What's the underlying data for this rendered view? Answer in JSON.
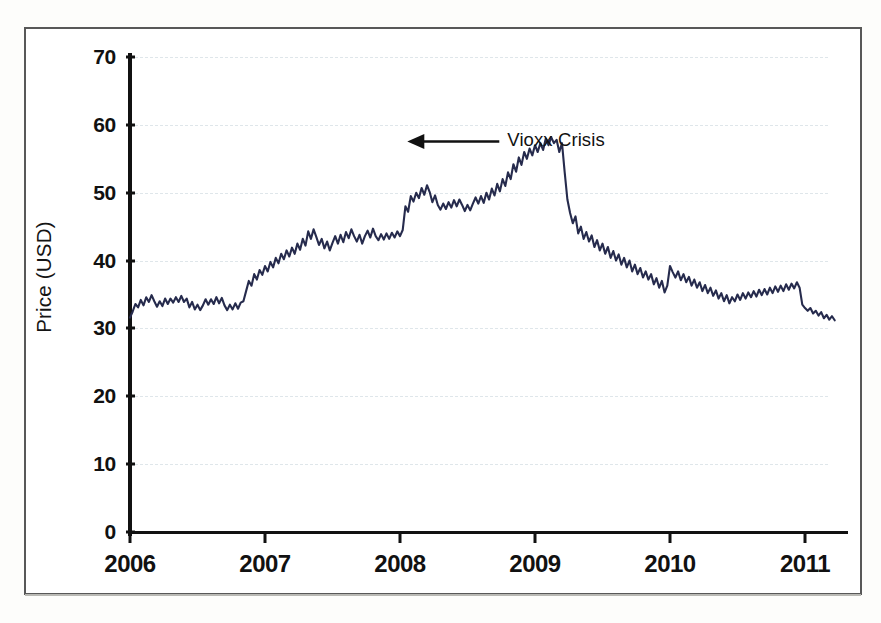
{
  "chart_data": {
    "type": "line",
    "title": "",
    "xlabel": "",
    "ylabel": "Price (USD)",
    "ylim": [
      0,
      70
    ],
    "ytick_values": [
      0,
      10,
      20,
      30,
      40,
      50,
      60,
      70
    ],
    "ytick_labels": [
      "0",
      "10",
      "20",
      "30",
      "40",
      "50",
      "60",
      "70"
    ],
    "xlim": [
      2006.0,
      2011.3
    ],
    "xtick_values": [
      2006,
      2007,
      2008,
      2009,
      2010,
      2011
    ],
    "xtick_labels": [
      "2006",
      "2007",
      "2008",
      "2009",
      "2010",
      "2011"
    ],
    "grid": "horizontal-dashed",
    "legend": "none",
    "line_color": "#262b4d",
    "series": [
      {
        "name": "Price (USD)",
        "x": [
          2006.0,
          2006.02,
          2006.04,
          2006.06,
          2006.08,
          2006.1,
          2006.12,
          2006.14,
          2006.16,
          2006.18,
          2006.2,
          2006.22,
          2006.24,
          2006.26,
          2006.28,
          2006.3,
          2006.32,
          2006.34,
          2006.36,
          2006.38,
          2006.4,
          2006.42,
          2006.44,
          2006.46,
          2006.48,
          2006.5,
          2006.52,
          2006.54,
          2006.56,
          2006.58,
          2006.6,
          2006.62,
          2006.64,
          2006.66,
          2006.68,
          2006.7,
          2006.72,
          2006.74,
          2006.76,
          2006.78,
          2006.8,
          2006.82,
          2006.84,
          2006.86,
          2006.88,
          2006.9,
          2006.92,
          2006.94,
          2006.96,
          2006.98,
          2007.0,
          2007.02,
          2007.04,
          2007.06,
          2007.08,
          2007.1,
          2007.12,
          2007.14,
          2007.16,
          2007.18,
          2007.2,
          2007.22,
          2007.24,
          2007.26,
          2007.28,
          2007.3,
          2007.32,
          2007.34,
          2007.36,
          2007.38,
          2007.4,
          2007.42,
          2007.44,
          2007.46,
          2007.48,
          2007.5,
          2007.52,
          2007.54,
          2007.56,
          2007.58,
          2007.6,
          2007.62,
          2007.64,
          2007.66,
          2007.68,
          2007.7,
          2007.72,
          2007.74,
          2007.76,
          2007.78,
          2007.8,
          2007.82,
          2007.84,
          2007.86,
          2007.88,
          2007.9,
          2007.92,
          2007.94,
          2007.96,
          2007.98,
          2008.0,
          2008.02,
          2008.04,
          2008.06,
          2008.08,
          2008.1,
          2008.12,
          2008.14,
          2008.16,
          2008.18,
          2008.2,
          2008.22,
          2008.24,
          2008.26,
          2008.28,
          2008.3,
          2008.32,
          2008.34,
          2008.36,
          2008.38,
          2008.4,
          2008.42,
          2008.44,
          2008.46,
          2008.48,
          2008.5,
          2008.52,
          2008.54,
          2008.56,
          2008.58,
          2008.6,
          2008.62,
          2008.64,
          2008.66,
          2008.68,
          2008.7,
          2008.72,
          2008.74,
          2008.76,
          2008.78,
          2008.8,
          2008.82,
          2008.84,
          2008.86,
          2008.88,
          2008.9,
          2008.92,
          2008.94,
          2008.96,
          2008.98,
          2009.0,
          2009.02,
          2009.04,
          2009.06,
          2009.08,
          2009.1,
          2009.12,
          2009.14,
          2009.16,
          2009.18,
          2009.2,
          2009.22,
          2009.24,
          2009.26,
          2009.28,
          2009.3,
          2009.32,
          2009.34,
          2009.36,
          2009.38,
          2009.4,
          2009.42,
          2009.44,
          2009.46,
          2009.48,
          2009.5,
          2009.52,
          2009.54,
          2009.56,
          2009.58,
          2009.6,
          2009.62,
          2009.64,
          2009.66,
          2009.68,
          2009.7,
          2009.72,
          2009.74,
          2009.76,
          2009.78,
          2009.8,
          2009.82,
          2009.84,
          2009.86,
          2009.88,
          2009.9,
          2009.92,
          2009.94,
          2009.96,
          2009.98,
          2010.0,
          2010.02,
          2010.04,
          2010.06,
          2010.08,
          2010.1,
          2010.12,
          2010.14,
          2010.16,
          2010.18,
          2010.2,
          2010.22,
          2010.24,
          2010.26,
          2010.28,
          2010.3,
          2010.32,
          2010.34,
          2010.36,
          2010.38,
          2010.4,
          2010.42,
          2010.44,
          2010.46,
          2010.48,
          2010.5,
          2010.52,
          2010.54,
          2010.56,
          2010.58,
          2010.6,
          2010.62,
          2010.64,
          2010.66,
          2010.68,
          2010.7,
          2010.72,
          2010.74,
          2010.76,
          2010.78,
          2010.8,
          2010.82,
          2010.84,
          2010.86,
          2010.88,
          2010.9,
          2010.92,
          2010.94,
          2010.96,
          2010.98,
          2011.0,
          2011.02,
          2011.04,
          2011.06,
          2011.08,
          2011.1,
          2011.12,
          2011.14,
          2011.16,
          2011.18,
          2011.2,
          2011.22
        ],
        "y": [
          31.6,
          32.5,
          33.6,
          33.1,
          34.2,
          33.4,
          34.6,
          33.9,
          34.9,
          34.0,
          33.2,
          34.0,
          33.3,
          34.4,
          33.6,
          34.4,
          33.8,
          34.6,
          33.9,
          34.8,
          33.9,
          34.4,
          33.1,
          33.9,
          32.8,
          33.5,
          32.7,
          33.4,
          34.3,
          33.5,
          34.3,
          33.6,
          34.6,
          33.7,
          34.5,
          33.4,
          32.7,
          33.5,
          32.8,
          33.7,
          32.9,
          33.8,
          34.0,
          35.5,
          37.0,
          36.3,
          38.0,
          37.2,
          38.6,
          37.9,
          39.2,
          38.4,
          39.8,
          39.0,
          40.4,
          39.6,
          41.0,
          40.2,
          41.5,
          40.6,
          41.9,
          41.0,
          42.5,
          41.6,
          43.2,
          42.2,
          44.3,
          43.2,
          44.6,
          43.5,
          42.3,
          43.2,
          41.8,
          42.8,
          41.5,
          42.6,
          43.6,
          42.5,
          43.8,
          42.7,
          44.2,
          43.3,
          44.6,
          43.6,
          42.8,
          43.8,
          42.5,
          43.6,
          44.4,
          43.4,
          44.7,
          43.6,
          43.0,
          43.9,
          43.1,
          44.0,
          43.2,
          44.1,
          43.4,
          44.3,
          43.6,
          44.5,
          48.0,
          47.2,
          49.5,
          48.7,
          50.0,
          49.2,
          50.7,
          49.7,
          51.1,
          50.1,
          48.6,
          49.6,
          48.2,
          47.5,
          48.4,
          47.6,
          48.6,
          47.8,
          48.9,
          48.0,
          49.0,
          48.2,
          47.3,
          48.2,
          47.4,
          48.4,
          49.3,
          48.4,
          49.5,
          48.5,
          50.0,
          49.0,
          50.6,
          49.6,
          51.3,
          50.2,
          52.0,
          51.0,
          53.0,
          52.0,
          54.2,
          53.1,
          55.2,
          54.1,
          56.0,
          55.0,
          56.5,
          55.5,
          57.0,
          56.0,
          57.3,
          56.3,
          58.0,
          57.0,
          58.2,
          57.3,
          57.8,
          56.0,
          57.3,
          53.0,
          49.0,
          47.0,
          45.5,
          46.5,
          44.0,
          45.0,
          43.2,
          44.2,
          42.8,
          43.7,
          42.0,
          43.0,
          41.5,
          42.5,
          41.0,
          42.0,
          40.4,
          41.4,
          40.0,
          40.9,
          39.4,
          40.4,
          39.0,
          40.0,
          38.4,
          39.4,
          38.0,
          38.9,
          37.5,
          38.4,
          37.2,
          38.0,
          36.5,
          37.4,
          36.0,
          37.0,
          35.3,
          36.3,
          39.2,
          38.3,
          37.5,
          38.4,
          37.1,
          38.0,
          36.8,
          37.6,
          36.3,
          37.2,
          36.0,
          36.8,
          35.5,
          36.4,
          35.2,
          36.0,
          34.8,
          35.6,
          34.4,
          35.2,
          34.0,
          34.9,
          33.7,
          34.6,
          34.0,
          35.0,
          34.2,
          35.2,
          34.4,
          35.3,
          34.6,
          35.5,
          34.7,
          35.7,
          34.9,
          35.8,
          35.0,
          36.0,
          35.2,
          36.2,
          35.4,
          36.3,
          35.5,
          36.5,
          35.7,
          36.6,
          35.9,
          36.8,
          36.0,
          33.5,
          33.0,
          32.6,
          33.0,
          32.2,
          32.6,
          31.9,
          32.4,
          31.5,
          32.0,
          31.3,
          31.8,
          31.2
        ]
      }
    ],
    "annotations": [
      {
        "text": "Vioxx Crisis",
        "x": 2007.98,
        "y": 58.0,
        "arrow": "left-pointing",
        "label_x": 2008.55,
        "label_y": 57.5
      }
    ]
  },
  "axis": {
    "y_label": "Price (USD)"
  }
}
